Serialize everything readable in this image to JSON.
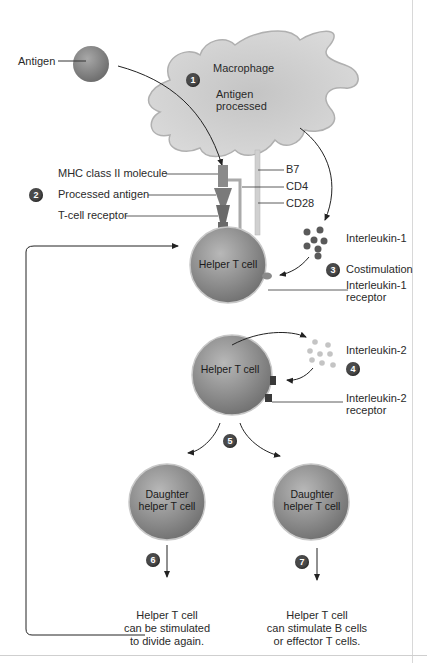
{
  "labels": {
    "antigen": "Antigen",
    "macrophage": "Macrophage",
    "antigen_processed_1": "Antigen",
    "antigen_processed_2": "processed",
    "mhc": "MHC class II molecule",
    "processed_antigen": "Processed antigen",
    "tcr": "T-cell receptor",
    "b7": "B7",
    "cd4": "CD4",
    "cd28": "CD28",
    "il1": "Interleukin-1",
    "costimulation": "Costimulation",
    "il1_receptor_1": "Interleukin-1",
    "il1_receptor_2": "receptor",
    "helper_t_cell_1": "Helper T cell",
    "helper_t_cell_2": "Helper T cell",
    "il2": "Interleukin-2",
    "il2_receptor_1": "Interleukin-2",
    "il2_receptor_2": "receptor",
    "daughter_1a": "Daughter",
    "daughter_1b": "helper T cell",
    "daughter_2a": "Daughter",
    "daughter_2b": "helper T cell",
    "outcome_6_1": "Helper T cell",
    "outcome_6_2": "can be stimulated",
    "outcome_6_3": "to divide again.",
    "outcome_7_1": "Helper T cell",
    "outcome_7_2": "can stimulate B cells",
    "outcome_7_3": "or effector T cells."
  },
  "steps": [
    "1",
    "2",
    "3",
    "4",
    "5",
    "6",
    "7"
  ],
  "colors": {
    "cell_fill": "#9a9a9a",
    "macrophage_fill": "#cfcfcf",
    "step_badge": "#4a4a4a",
    "line": "#333333"
  }
}
